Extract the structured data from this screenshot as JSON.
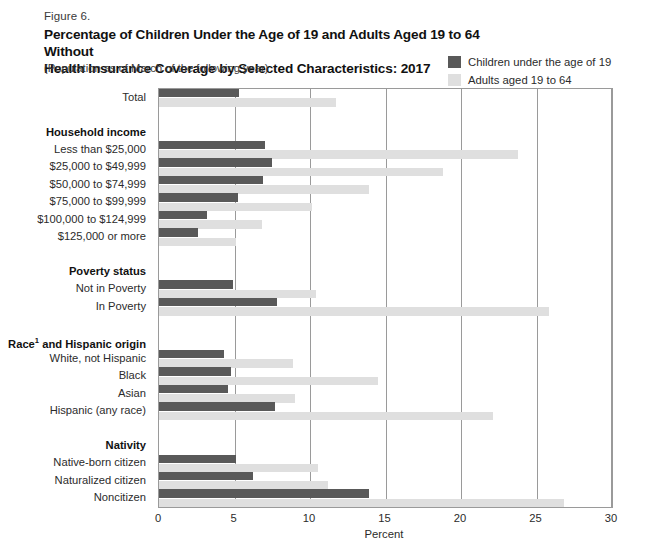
{
  "figure": {
    "label": "Figure 6.",
    "title_line1": "Percentage of Children Under the Age of 19 and Adults Aged 19 to 64 Without",
    "title_line2": "Health Insurance Coverage by Selected Characteristics: 2017",
    "subtitle": "(Population as of March of the following year)"
  },
  "legend": {
    "position": "top-right",
    "items": [
      {
        "label": "Children under the age of 19",
        "color": "#595959",
        "swatch_name": "legend-swatch-children"
      },
      {
        "label": "Adults aged 19 to 64",
        "color": "#dfdfdf",
        "swatch_name": "legend-swatch-adults"
      }
    ]
  },
  "chart_data": {
    "type": "bar",
    "orientation": "horizontal",
    "title": "Percentage of Children Under the Age of 19 and Adults Aged 19 to 64 Without Health Insurance Coverage by Selected Characteristics: 2017",
    "xlabel": "Percent",
    "ylabel": "",
    "xlim": [
      0,
      30
    ],
    "xticks": [
      0,
      5,
      10,
      15,
      20,
      25,
      30
    ],
    "grid": true,
    "legend": [
      "Children under the age of 19",
      "Adults aged 19 to 64"
    ],
    "categories": [
      "Total",
      "Less than $25,000",
      "$25,000 to $49,999",
      "$50,000 to $74,999",
      "$75,000 to $99,999",
      "$100,000 to $124,999",
      "$125,000 or more",
      "Not in Poverty",
      "In Poverty",
      "White, not Hispanic",
      "Black",
      "Asian",
      "Hispanic (any race)",
      "Native-born citizen",
      "Naturalized citizen",
      "Noncitizen"
    ],
    "group_headings": [
      "Household income",
      "Poverty status",
      "Race¹ and Hispanic origin",
      "Nativity"
    ],
    "series": [
      {
        "name": "Children under the age of 19",
        "color": "#595959",
        "values": [
          5.3,
          7.0,
          7.5,
          6.9,
          5.2,
          3.2,
          2.6,
          4.9,
          7.8,
          4.3,
          4.8,
          4.6,
          7.7,
          5.1,
          6.2,
          13.9
        ]
      },
      {
        "name": "Adults aged 19 to 64",
        "color": "#dfdfdf",
        "values": [
          11.7,
          23.8,
          18.8,
          13.9,
          10.1,
          6.8,
          5.1,
          10.4,
          25.8,
          8.9,
          14.5,
          9.0,
          22.1,
          10.5,
          11.2,
          26.8
        ]
      }
    ]
  },
  "axis": {
    "tick_labels": [
      "0",
      "5",
      "10",
      "15",
      "20",
      "25",
      "30"
    ],
    "x_axis_title": "Percent"
  },
  "rows": [
    {
      "kind": "cat",
      "label": "Total",
      "ci": 0
    },
    {
      "kind": "gap"
    },
    {
      "kind": "group",
      "label": "Household income"
    },
    {
      "kind": "cat",
      "label": "Less than $25,000",
      "ci": 1
    },
    {
      "kind": "cat",
      "label": "$25,000 to $49,999",
      "ci": 2
    },
    {
      "kind": "cat",
      "label": "$50,000 to $74,999",
      "ci": 3
    },
    {
      "kind": "cat",
      "label": "$75,000 to $99,999",
      "ci": 4
    },
    {
      "kind": "cat",
      "label": "$100,000 to $124,999",
      "ci": 5
    },
    {
      "kind": "cat",
      "label": "$125,000 or more",
      "ci": 6
    },
    {
      "kind": "gap"
    },
    {
      "kind": "group",
      "label": "Poverty status"
    },
    {
      "kind": "cat",
      "label": "Not in Poverty",
      "ci": 7
    },
    {
      "kind": "cat",
      "label": "In Poverty",
      "ci": 8
    },
    {
      "kind": "gap"
    },
    {
      "kind": "group",
      "label": "Race¹ and Hispanic origin",
      "sup": "1",
      "base": "Race",
      "rest": " and Hispanic origin"
    },
    {
      "kind": "cat",
      "label": "White, not Hispanic",
      "ci": 9
    },
    {
      "kind": "cat",
      "label": "Black",
      "ci": 10
    },
    {
      "kind": "cat",
      "label": "Asian",
      "ci": 11
    },
    {
      "kind": "cat",
      "label": "Hispanic (any race)",
      "ci": 12
    },
    {
      "kind": "gap"
    },
    {
      "kind": "group",
      "label": "Nativity"
    },
    {
      "kind": "cat",
      "label": "Native-born citizen",
      "ci": 13
    },
    {
      "kind": "cat",
      "label": "Naturalized citizen",
      "ci": 14
    },
    {
      "kind": "cat",
      "label": "Noncitizen",
      "ci": 15
    }
  ]
}
